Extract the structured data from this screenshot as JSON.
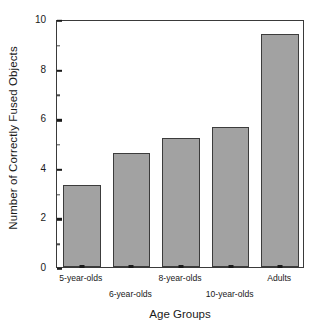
{
  "chart_data": {
    "type": "bar",
    "title": "",
    "xlabel": "Age Groups",
    "ylabel": "Number of Correctly Fused Objects",
    "categories": [
      "5-year-olds",
      "6-year-olds",
      "8-year-olds",
      "10-year-olds",
      "Adults"
    ],
    "values": [
      3.3,
      4.6,
      5.2,
      5.65,
      9.4
    ],
    "ylim": [
      0,
      10
    ],
    "xlim": [
      0,
      5
    ],
    "ytick_labels": [
      "0",
      "2",
      "4",
      "6",
      "8",
      "10"
    ],
    "ytick_values": [
      0,
      2,
      4,
      6,
      8,
      10
    ],
    "yminor_values": [
      1,
      3,
      5,
      7,
      9
    ],
    "grid": false,
    "legend": false,
    "legend_position": "none",
    "bar_color": "#a2a2a2",
    "bar_edge_color": "#3c3c3c",
    "axis_color": "#3a3a3a",
    "background_color": "#ffffff",
    "xtick_label_rows": [
      0,
      1,
      0,
      1,
      0
    ]
  }
}
